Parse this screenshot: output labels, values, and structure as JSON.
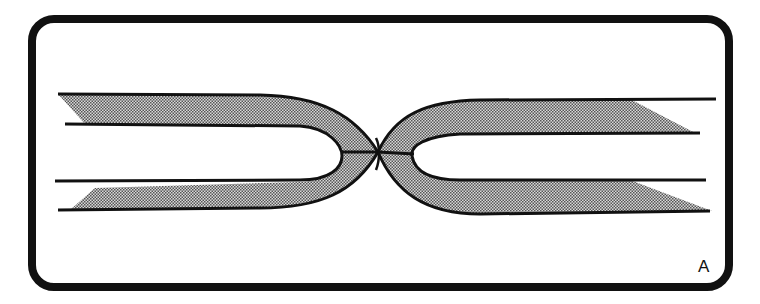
{
  "figure": {
    "panel_label": "A",
    "colors": {
      "frame": "#111111",
      "stroke": "#111111",
      "fill_stipple": "#8c8c8c",
      "background": "#ffffff"
    },
    "elements": [
      {
        "name": "left-loop",
        "shape": "U-shaped shaded band opening to the left"
      },
      {
        "name": "right-loop",
        "shape": "U-shaped shaded band opening to the right"
      },
      {
        "name": "junction",
        "shape": "contact point where both loops touch at center"
      }
    ]
  }
}
